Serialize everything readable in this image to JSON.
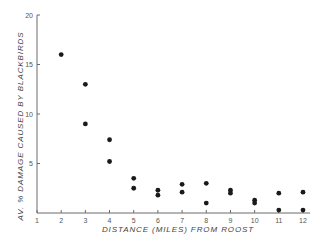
{
  "chart_data": {
    "type": "scatter",
    "title": "",
    "xlabel": "DISTANCE (MILES) FROM ROOST",
    "ylabel": "AV. % DAMAGE CAUSED BY BLACKBIRDS",
    "xlim": [
      1,
      12
    ],
    "ylim": [
      0,
      20
    ],
    "xticks": [
      1,
      2,
      3,
      4,
      5,
      6,
      7,
      8,
      9,
      10,
      11,
      12
    ],
    "yticks": [
      5,
      10,
      15,
      20
    ],
    "grid": false,
    "legend": null,
    "series": [
      {
        "name": "observations",
        "points": [
          {
            "x": 2,
            "y": 16.0
          },
          {
            "x": 3,
            "y": 13.0
          },
          {
            "x": 3,
            "y": 9.0
          },
          {
            "x": 4,
            "y": 7.4
          },
          {
            "x": 4,
            "y": 5.2
          },
          {
            "x": 5,
            "y": 3.5
          },
          {
            "x": 5,
            "y": 2.5
          },
          {
            "x": 6,
            "y": 2.3
          },
          {
            "x": 6,
            "y": 1.8
          },
          {
            "x": 7,
            "y": 2.9
          },
          {
            "x": 7,
            "y": 2.1
          },
          {
            "x": 8,
            "y": 3.0
          },
          {
            "x": 8,
            "y": 1.0
          },
          {
            "x": 9,
            "y": 2.3
          },
          {
            "x": 9,
            "y": 2.0
          },
          {
            "x": 10,
            "y": 1.3
          },
          {
            "x": 10,
            "y": 1.0
          },
          {
            "x": 11,
            "y": 2.0
          },
          {
            "x": 11,
            "y": 0.3
          },
          {
            "x": 12,
            "y": 2.1
          },
          {
            "x": 12,
            "y": 0.3
          }
        ]
      }
    ]
  },
  "style": {
    "axis_color": "#6a6a6a",
    "point_color": "#1a1a1a",
    "text_color": "#555555"
  }
}
